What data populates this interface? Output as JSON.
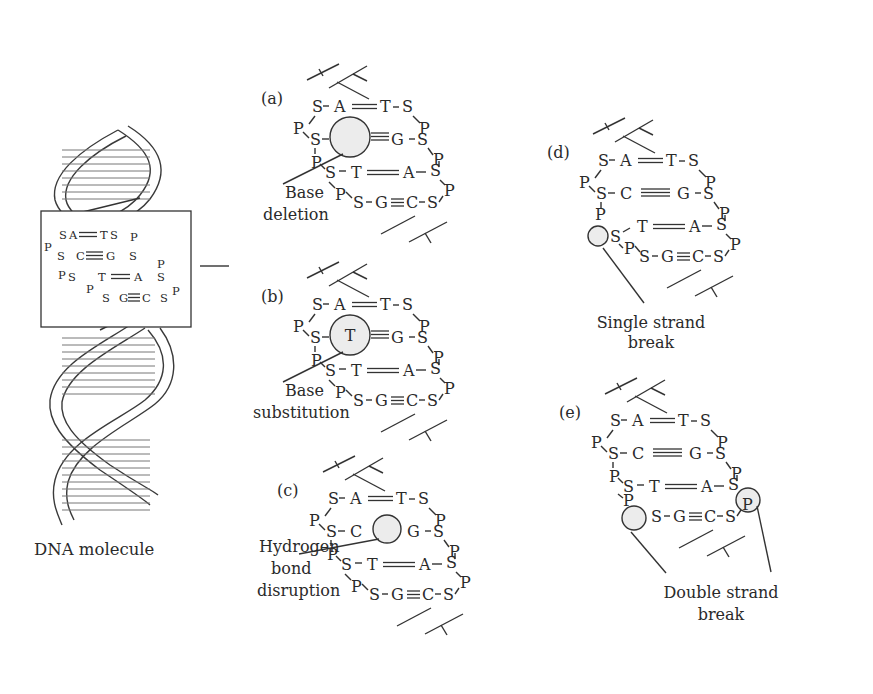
{
  "figure": {
    "molecule_caption": "DNA molecule",
    "inset_pairs": [
      {
        "left": "A",
        "bond": "double",
        "right": "T"
      },
      {
        "left": "C",
        "bond": "triple",
        "right": "G"
      },
      {
        "left": "T",
        "bond": "double",
        "right": "A"
      },
      {
        "left": "G",
        "bond": "triple",
        "right": "C"
      }
    ],
    "panels": [
      {
        "id": "a",
        "tag": "(a)",
        "label_lines": [
          "Base",
          "deletion"
        ],
        "lesion": "deleted-base",
        "lesion_text": "",
        "pairs": [
          {
            "left": "A",
            "bond": "double",
            "right": "T"
          },
          {
            "left": "",
            "bond": "triple",
            "right": "G"
          },
          {
            "left": "T",
            "bond": "double",
            "right": "A"
          },
          {
            "left": "G",
            "bond": "triple",
            "right": "C"
          }
        ]
      },
      {
        "id": "b",
        "tag": "(b)",
        "label_lines": [
          "Base",
          "substitution"
        ],
        "lesion": "substituted-base",
        "lesion_text": "T",
        "pairs": [
          {
            "left": "A",
            "bond": "double",
            "right": "T"
          },
          {
            "left": "T",
            "bond": "triple",
            "right": "G"
          },
          {
            "left": "T",
            "bond": "double",
            "right": "A"
          },
          {
            "left": "G",
            "bond": "triple",
            "right": "C"
          }
        ]
      },
      {
        "id": "c",
        "tag": "(c)",
        "label_lines": [
          "Hydrogen",
          "bond",
          "disruption"
        ],
        "lesion": "hydrogen-bond-disruption",
        "lesion_text": "",
        "pairs": [
          {
            "left": "A",
            "bond": "double",
            "right": "T"
          },
          {
            "left": "C",
            "bond": "broken",
            "right": "G"
          },
          {
            "left": "T",
            "bond": "double",
            "right": "A"
          },
          {
            "left": "G",
            "bond": "triple",
            "right": "C"
          }
        ]
      },
      {
        "id": "d",
        "tag": "(d)",
        "label_lines": [
          "Single strand",
          "break"
        ],
        "lesion": "single-strand-break",
        "lesion_text": "",
        "pairs": [
          {
            "left": "A",
            "bond": "double",
            "right": "T"
          },
          {
            "left": "C",
            "bond": "triple",
            "right": "G"
          },
          {
            "left": "T",
            "bond": "double",
            "right": "A"
          },
          {
            "left": "G",
            "bond": "triple",
            "right": "C"
          }
        ]
      },
      {
        "id": "e",
        "tag": "(e)",
        "label_lines": [
          "Double strand",
          "break"
        ],
        "lesion": "double-strand-break",
        "lesion_text": "",
        "pairs": [
          {
            "left": "A",
            "bond": "double",
            "right": "T"
          },
          {
            "left": "C",
            "bond": "triple",
            "right": "G"
          },
          {
            "left": "T",
            "bond": "double",
            "right": "A"
          },
          {
            "left": "G",
            "bond": "triple",
            "right": "C"
          }
        ]
      }
    ],
    "backbone": {
      "sugar": "S",
      "phosphate": "P"
    },
    "colors": {
      "ink": "#2a2a2a",
      "lesion_fill": "#ececec",
      "background": "#ffffff"
    }
  }
}
